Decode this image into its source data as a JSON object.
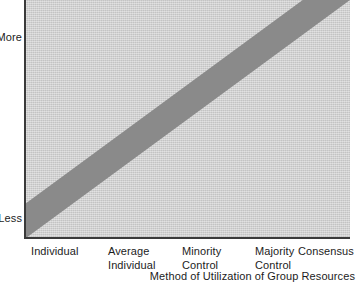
{
  "chart_data": {
    "type": "line",
    "title": "",
    "subtitle": "",
    "xlabel": "Method of Utilization of Group Resources",
    "ylabel": "",
    "categories": [
      "Individual",
      "Average Individual",
      "Minority Control",
      "Majority Control",
      "Consensus"
    ],
    "x": [
      0,
      1,
      2,
      3,
      4
    ],
    "y_tick_labels": [
      "Less",
      "More"
    ],
    "ylim": [
      "Less",
      "More"
    ],
    "grid": false,
    "legend": null,
    "series": [
      {
        "name": "Quality of Group Product",
        "style": "thick-diagonal-band",
        "band_color": "#8a8a8a",
        "values": [
          0,
          1,
          2,
          3,
          4
        ],
        "description": "Thick shaded band rising linearly from the lower-left origin (Individual / Less) to the upper-right corner (Consensus / More)",
        "band_thickness_px": 28
      }
    ],
    "plot_background": "#cfcfcf",
    "axis_color": "#3a3a3a"
  },
  "axes": {
    "y": {
      "top_label": "More",
      "bottom_label": "Less"
    },
    "x": {
      "title": "Method of Utilization of Group Resources",
      "ticks": [
        {
          "line1": "Individual",
          "line2": ""
        },
        {
          "line1": "Average",
          "line2": "Individual"
        },
        {
          "line1": "Minority",
          "line2": "Control"
        },
        {
          "line1": "Majority",
          "line2": "Control"
        },
        {
          "line1": "Consensus",
          "line2": ""
        }
      ]
    }
  },
  "colors": {
    "band": "#8a8a8a",
    "plot_background": "#cfcfcf",
    "axis": "#3a3a3a",
    "text": "#1c1c1c",
    "page_background": "#ffffff"
  }
}
